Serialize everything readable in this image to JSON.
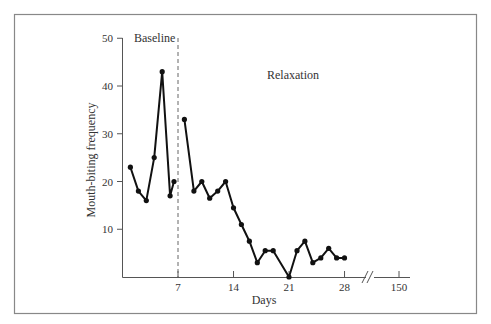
{
  "chart_data": {
    "type": "line",
    "title": "",
    "xlabel": "Days",
    "ylabel": "Mouth-biting frequency",
    "xlim": [
      0,
      28
    ],
    "ylim": [
      0,
      50
    ],
    "x_ticks": [
      "7",
      "14",
      "21",
      "28",
      "150"
    ],
    "y_ticks": [
      "10",
      "20",
      "30",
      "40",
      "50"
    ],
    "axis_break": {
      "between": [
        "28",
        "150"
      ],
      "symbol": "//"
    },
    "grid": false,
    "legend": null,
    "phase_change_line": {
      "x": 7,
      "style": "dashed"
    },
    "annotations": [
      {
        "text": "Baseline",
        "position": "top-left of baseline phase"
      },
      {
        "text": "Relaxation",
        "position": "top of relaxation phase"
      }
    ],
    "series": [
      {
        "name": "Baseline",
        "x": [
          1,
          2,
          3,
          4,
          5,
          6,
          6.5
        ],
        "values": [
          23,
          18,
          16,
          25,
          43,
          17,
          20
        ]
      },
      {
        "name": "Relaxation",
        "x": [
          7.8,
          9,
          10,
          11,
          12,
          13,
          14,
          15,
          16,
          17,
          18,
          19,
          21,
          22,
          23,
          24,
          25,
          26,
          27,
          28
        ],
        "values": [
          33,
          18,
          20,
          16.5,
          18,
          20,
          14.5,
          11,
          7.5,
          3,
          5.5,
          5.5,
          0,
          5.5,
          7.5,
          3,
          4,
          6,
          4,
          4
        ]
      }
    ]
  },
  "labels": {
    "baseline": "Baseline",
    "relaxation": "Relaxation",
    "xlabel": "Days",
    "ylabel": "Mouth-biting frequency",
    "break_symbol": "//"
  },
  "colors": {
    "line": "#111111",
    "axis": "#555555",
    "frame": "#888888",
    "text": "#333333"
  }
}
